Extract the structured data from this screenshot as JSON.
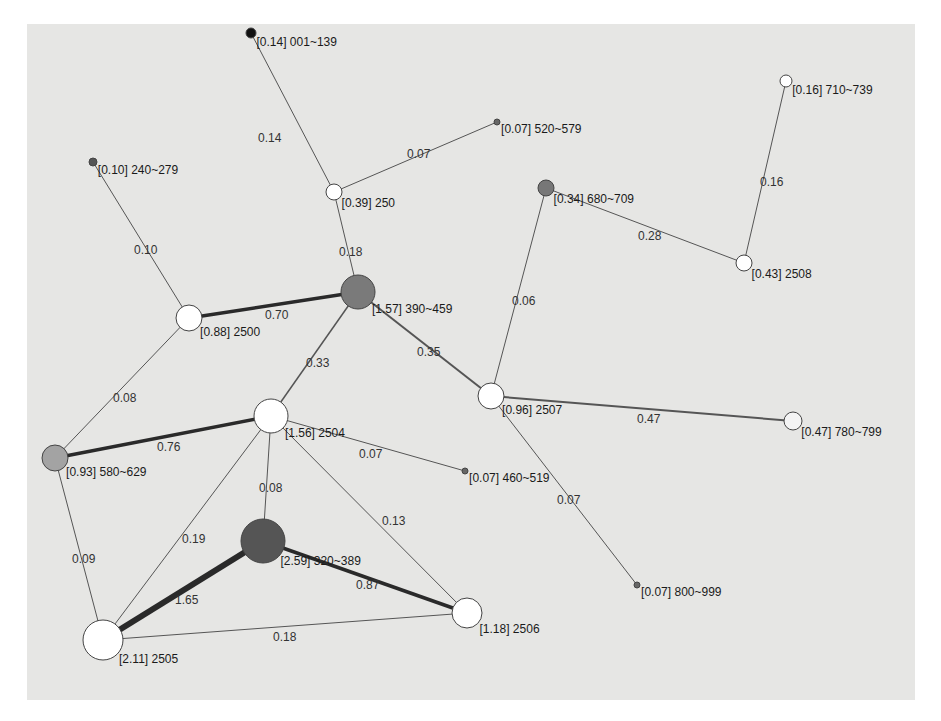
{
  "diagram": {
    "type": "network-graph",
    "background": "#e6e6e4",
    "nodes": [
      {
        "id": "n001",
        "label": "[0.14] 001~139",
        "x": 251,
        "y": 33,
        "r": 5,
        "fill": "#111111"
      },
      {
        "id": "n520",
        "label": "[0.07] 520~579",
        "x": 497,
        "y": 122,
        "r": 3,
        "fill": "#666666"
      },
      {
        "id": "n710",
        "label": "[0.16] 710~739",
        "x": 786,
        "y": 81,
        "r": 6,
        "fill": "#ffffff"
      },
      {
        "id": "n240",
        "label": "[0.10] 240~279",
        "x": 93,
        "y": 162,
        "r": 4,
        "fill": "#555555"
      },
      {
        "id": "n250",
        "label": "[0.39] 250",
        "x": 334,
        "y": 192,
        "r": 8,
        "fill": "#ffffff"
      },
      {
        "id": "n680",
        "label": "[0.34] 680~709",
        "x": 546,
        "y": 188,
        "r": 8,
        "fill": "#777777"
      },
      {
        "id": "n2508",
        "label": "[0.43] 2508",
        "x": 744,
        "y": 263,
        "r": 8,
        "fill": "#ffffff"
      },
      {
        "id": "n390",
        "label": "[1.57] 390~459",
        "x": 358,
        "y": 292,
        "r": 17,
        "fill": "#7a7a7a"
      },
      {
        "id": "n2500",
        "label": "[0.88] 2500",
        "x": 189,
        "y": 318,
        "r": 13,
        "fill": "#ffffff"
      },
      {
        "id": "n2507",
        "label": "[0.96] 2507",
        "x": 491,
        "y": 396,
        "r": 13,
        "fill": "#ffffff"
      },
      {
        "id": "n780",
        "label": "[0.47] 780~799",
        "x": 793,
        "y": 421,
        "r": 9,
        "fill": "#f4f4f4"
      },
      {
        "id": "n2504",
        "label": "[1.56] 2504",
        "x": 271,
        "y": 416,
        "r": 17,
        "fill": "#ffffff"
      },
      {
        "id": "n580",
        "label": "[0.93] 580~629",
        "x": 55,
        "y": 458,
        "r": 13,
        "fill": "#a3a3a3"
      },
      {
        "id": "n460",
        "label": "[0.07] 460~519",
        "x": 465,
        "y": 471,
        "r": 3,
        "fill": "#666666"
      },
      {
        "id": "n320",
        "label": "[2.59] 320~389",
        "x": 263,
        "y": 541,
        "r": 22,
        "fill": "#555555"
      },
      {
        "id": "n800",
        "label": "[0.07] 800~999",
        "x": 637,
        "y": 585,
        "r": 3,
        "fill": "#666666"
      },
      {
        "id": "n2506",
        "label": "[1.18] 2506",
        "x": 467,
        "y": 613,
        "r": 15,
        "fill": "#ffffff"
      },
      {
        "id": "n2505",
        "label": "[2.11] 2505",
        "x": 103,
        "y": 640,
        "r": 20,
        "fill": "#ffffff"
      }
    ],
    "edges": [
      {
        "from": "n001",
        "to": "n250",
        "label": "0.14",
        "lx": 258,
        "ly": 142,
        "w": 1
      },
      {
        "from": "n520",
        "to": "n250",
        "label": "0.07",
        "lx": 407,
        "ly": 158,
        "w": 1
      },
      {
        "from": "n710",
        "to": "n2508",
        "label": "0.16",
        "lx": 760,
        "ly": 186,
        "w": 1
      },
      {
        "from": "n680",
        "to": "n2508",
        "label": "0.28",
        "lx": 638,
        "ly": 240,
        "w": 1
      },
      {
        "from": "n240",
        "to": "n2500",
        "label": "0.10",
        "lx": 134,
        "ly": 254,
        "w": 1
      },
      {
        "from": "n250",
        "to": "n390",
        "label": "0.18",
        "lx": 339,
        "ly": 256,
        "w": 1
      },
      {
        "from": "n2500",
        "to": "n390",
        "label": "0.70",
        "lx": 265,
        "ly": 319,
        "w": 3.5
      },
      {
        "from": "n680",
        "to": "n2507",
        "label": "0.06",
        "lx": 512,
        "ly": 305,
        "w": 1
      },
      {
        "from": "n390",
        "to": "n2507",
        "label": "0.35",
        "lx": 417,
        "ly": 356,
        "w": 2
      },
      {
        "from": "n390",
        "to": "n2504",
        "label": "0.33",
        "lx": 306,
        "ly": 367,
        "w": 1.5
      },
      {
        "from": "n2500",
        "to": "n580",
        "label": "0.08",
        "lx": 113,
        "ly": 402,
        "w": 1
      },
      {
        "from": "n2507",
        "to": "n780",
        "label": "0.47",
        "lx": 637,
        "ly": 423,
        "w": 2
      },
      {
        "from": "n2504",
        "to": "n580",
        "label": "0.76",
        "lx": 157,
        "ly": 451,
        "w": 3.5
      },
      {
        "from": "n2504",
        "to": "n460",
        "label": "0.07",
        "lx": 359,
        "ly": 458,
        "w": 1
      },
      {
        "from": "n2507",
        "to": "n800",
        "label": "0.07",
        "lx": 557,
        "ly": 504,
        "w": 1
      },
      {
        "from": "n2504",
        "to": "n320",
        "label": "0.08",
        "lx": 259,
        "ly": 492,
        "w": 1
      },
      {
        "from": "n2504",
        "to": "n2506",
        "label": "0.13",
        "lx": 382,
        "ly": 525,
        "w": 1
      },
      {
        "from": "n2504",
        "to": "n2505",
        "label": "0.19",
        "lx": 182,
        "ly": 543,
        "w": 1
      },
      {
        "from": "n580",
        "to": "n2505",
        "label": "0.09",
        "lx": 72,
        "ly": 563,
        "w": 1
      },
      {
        "from": "n320",
        "to": "n2506",
        "label": "0.87",
        "lx": 356,
        "ly": 589,
        "w": 3.5
      },
      {
        "from": "n320",
        "to": "n2505",
        "label": "1.65",
        "lx": 175,
        "ly": 604,
        "w": 6
      },
      {
        "from": "n2505",
        "to": "n2506",
        "label": "0.18",
        "lx": 273,
        "ly": 641,
        "w": 1
      }
    ]
  }
}
